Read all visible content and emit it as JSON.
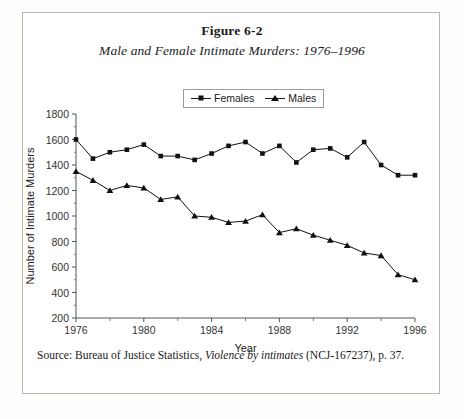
{
  "figure": {
    "number": "Figure 6-2",
    "title": "Male and Female Intimate Murders: 1976–1996",
    "source_prefix": "Source: Bureau of Justice Statistics, ",
    "source_italic": "Violence by intimates",
    "source_suffix": " (NCJ-167237), p. 37."
  },
  "legend": {
    "position": "top-center",
    "items": [
      {
        "label": "Females",
        "marker": "square-marker"
      },
      {
        "label": "Males",
        "marker": "triangle-marker"
      }
    ]
  },
  "chart_data": {
    "type": "line",
    "title": "Male and Female Intimate Murders: 1976–1996",
    "xlabel": "Year",
    "ylabel": "Number of Intimate Murders",
    "xlim": [
      1976,
      1996
    ],
    "ylim": [
      200,
      1800
    ],
    "ytick_step": 200,
    "grid": false,
    "x": [
      1976,
      1977,
      1978,
      1979,
      1980,
      1981,
      1982,
      1983,
      1984,
      1985,
      1986,
      1987,
      1988,
      1989,
      1990,
      1991,
      1992,
      1993,
      1994,
      1995,
      1996
    ],
    "xticks": [
      1976,
      1980,
      1984,
      1988,
      1992,
      1996
    ],
    "xminorticks": [
      1978,
      1982,
      1986,
      1990,
      1994
    ],
    "yticks": [
      200,
      400,
      600,
      800,
      1000,
      1200,
      1400,
      1600,
      1800
    ],
    "series": [
      {
        "name": "Females",
        "marker": "square",
        "color": "#111111",
        "values": [
          1600,
          1450,
          1500,
          1520,
          1560,
          1470,
          1470,
          1440,
          1490,
          1550,
          1580,
          1490,
          1550,
          1420,
          1520,
          1530,
          1460,
          1580,
          1400,
          1320,
          1320
        ]
      },
      {
        "name": "Males",
        "marker": "triangle",
        "color": "#111111",
        "values": [
          1350,
          1280,
          1200,
          1240,
          1220,
          1130,
          1150,
          1000,
          990,
          950,
          960,
          1010,
          870,
          900,
          850,
          810,
          770,
          710,
          690,
          540,
          500
        ]
      }
    ]
  }
}
